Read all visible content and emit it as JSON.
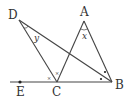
{
  "diagram": {
    "points": {
      "A": {
        "label": "A",
        "x": 84,
        "y": 21
      },
      "B": {
        "label": "B",
        "x": 112,
        "y": 82
      },
      "C": {
        "label": "C",
        "x": 57,
        "y": 82
      },
      "D": {
        "label": "D",
        "x": 19,
        "y": 20
      },
      "E": {
        "label": "E",
        "x": 20,
        "y": 82
      }
    },
    "angles": {
      "x": {
        "label": "x",
        "at": "A"
      },
      "y": {
        "label": "y",
        "at": "D"
      },
      "c_left": {
        "label": "×",
        "at": "C"
      },
      "c_right": {
        "label": "×",
        "at": "C"
      }
    },
    "segments": [
      "DC",
      "DB",
      "AC",
      "AB",
      "EB"
    ],
    "colors": {
      "line": "#444444",
      "text": "#333333"
    }
  }
}
